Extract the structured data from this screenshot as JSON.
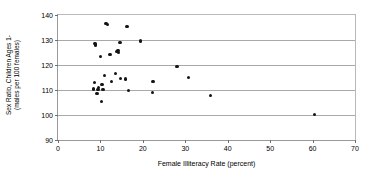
{
  "chart_data": {
    "type": "scatter",
    "title": "",
    "xlabel": "Female Illiteracy Rate (percent)",
    "ylabel_line1": "Sex Ratio, Children Ages 1-",
    "ylabel_line2": "(males per 100 females)",
    "xlim": [
      0,
      70
    ],
    "ylim": [
      90,
      140
    ],
    "xticks": [
      0,
      10,
      20,
      30,
      40,
      50,
      60,
      70
    ],
    "yticks": [
      90,
      100,
      110,
      120,
      130,
      140
    ],
    "grid": "horizontal",
    "legend": "none",
    "marker": "filled-circle",
    "marker_color": "#141414",
    "points": [
      {
        "x": 8.3,
        "y": 110.6
      },
      {
        "x": 8.4,
        "y": 110.2
      },
      {
        "x": 8.6,
        "y": 112.9
      },
      {
        "x": 8.7,
        "y": 128.6
      },
      {
        "x": 8.8,
        "y": 127.9
      },
      {
        "x": 8.9,
        "y": 128.3
      },
      {
        "x": 9.2,
        "y": 108.6
      },
      {
        "x": 9.4,
        "y": 110.3
      },
      {
        "x": 9.6,
        "y": 111.1
      },
      {
        "x": 10.0,
        "y": 123.5
      },
      {
        "x": 10.2,
        "y": 105.4
      },
      {
        "x": 10.4,
        "y": 112.2
      },
      {
        "x": 10.6,
        "y": 110.2
      },
      {
        "x": 10.9,
        "y": 115.9
      },
      {
        "x": 11.3,
        "y": 136.5
      },
      {
        "x": 11.6,
        "y": 136.2
      },
      {
        "x": 12.3,
        "y": 124.1
      },
      {
        "x": 12.6,
        "y": 113.4
      },
      {
        "x": 13.6,
        "y": 116.7
      },
      {
        "x": 13.9,
        "y": 125.3
      },
      {
        "x": 14.1,
        "y": 125.9
      },
      {
        "x": 14.3,
        "y": 124.9
      },
      {
        "x": 14.6,
        "y": 128.9
      },
      {
        "x": 14.8,
        "y": 114.6
      },
      {
        "x": 15.9,
        "y": 114.4
      },
      {
        "x": 16.3,
        "y": 135.5
      },
      {
        "x": 16.6,
        "y": 109.7
      },
      {
        "x": 19.5,
        "y": 129.6
      },
      {
        "x": 22.2,
        "y": 108.9
      },
      {
        "x": 22.4,
        "y": 113.3
      },
      {
        "x": 28.0,
        "y": 119.4
      },
      {
        "x": 30.8,
        "y": 114.9
      },
      {
        "x": 36.0,
        "y": 107.7
      },
      {
        "x": 60.5,
        "y": 100.3
      }
    ]
  }
}
